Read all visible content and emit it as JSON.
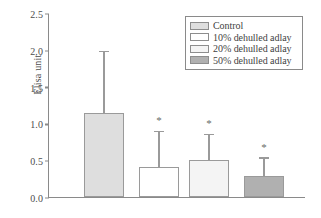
{
  "chart_data": {
    "type": "bar",
    "title": "",
    "xlabel": "",
    "ylabel": "Elisa unit",
    "ylim": [
      0.0,
      2.5
    ],
    "yticks": [
      "0.0",
      "0.5",
      "1.0",
      "1.5",
      "2.0",
      "2.5"
    ],
    "ytick_values": [
      0.0,
      0.5,
      1.0,
      1.5,
      2.0,
      2.5
    ],
    "grid": false,
    "legend_position": "top-right",
    "categories": [
      "Control",
      "10% dehulled adlay",
      "20% dehulled adlay",
      "50% dehulled adlay"
    ],
    "values": [
      1.14,
      0.41,
      0.5,
      0.29
    ],
    "errors_upper": [
      1.97,
      0.88,
      0.84,
      0.52
    ],
    "annotations": [
      "",
      "*",
      "*",
      "*"
    ],
    "series": [
      {
        "name": "Elisa unit",
        "values": [
          1.14,
          0.41,
          0.5,
          0.29
        ]
      }
    ],
    "bar_colors": [
      "#dedede",
      "#ffffff",
      "#f4f4f4",
      "#b0b0b0"
    ],
    "bar_edge_color": "#9a9a9a",
    "error_color": "#9a9a9a",
    "axis_color": "#8a8a8a"
  },
  "legend": {
    "items": [
      {
        "label": "Control",
        "color": "#dedede"
      },
      {
        "label": "10% dehulled adlay",
        "color": "#ffffff"
      },
      {
        "label": "20% dehulled adlay",
        "color": "#f4f4f4"
      },
      {
        "label": "50% dehulled adlay",
        "color": "#b0b0b0"
      }
    ]
  },
  "axis": {
    "y_label": "Elisa unit",
    "tick_0": "0.0",
    "tick_1": "0.5",
    "tick_2": "1.0",
    "tick_3": "1.5",
    "tick_4": "2.0",
    "tick_5": "2.5"
  },
  "significance_marker": "*"
}
